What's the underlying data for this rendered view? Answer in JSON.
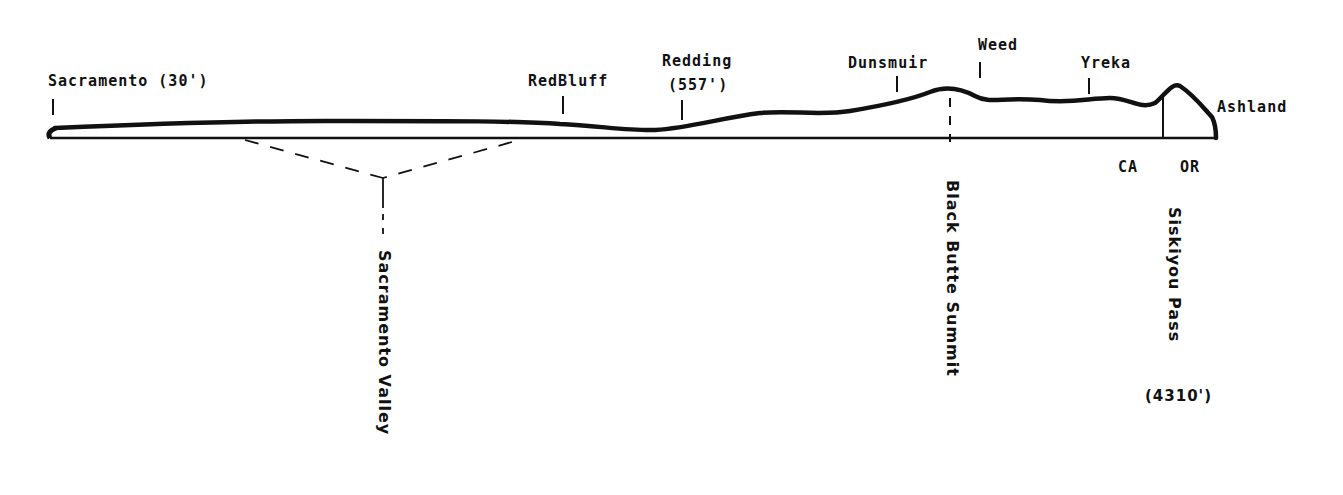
{
  "diagram": {
    "type": "elevation-profile",
    "colors": {
      "ink": "#111111",
      "background": "#ffffff"
    },
    "towns": [
      {
        "name": "Sacramento (30')"
      },
      {
        "name": "RedBluff"
      },
      {
        "name": "Redding",
        "elevation": "(557')"
      },
      {
        "name": "Dunsmuir"
      },
      {
        "name": "Weed"
      },
      {
        "name": "Yreka"
      },
      {
        "name": "Ashland"
      }
    ],
    "states": {
      "left": "CA",
      "right": "OR"
    },
    "features": {
      "valley": "Sacramento Valley",
      "summit": "Black Butte Summit",
      "pass": "Siskiyou Pass",
      "pass_elevation": "(4310')"
    }
  }
}
